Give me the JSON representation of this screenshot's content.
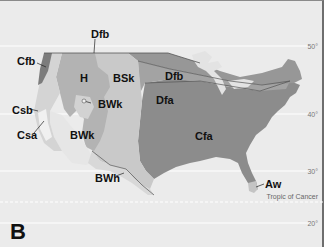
{
  "map": {
    "panel_letter": "B",
    "latitudes": [
      {
        "label": "50°",
        "y": 45
      },
      {
        "label": "40°",
        "y": 113
      },
      {
        "label": "30°",
        "y": 170
      },
      {
        "label": "20°",
        "y": 222
      }
    ],
    "tropic_label": "Tropic of Cancer",
    "regions": {
      "Cfb": "Cfb",
      "Dfb_north": "Dfb",
      "H": "H",
      "BSk": "BSk",
      "Dfb": "Dfb",
      "Dfa": "Dfa",
      "BWk_small": "BWk",
      "Csb": "Csb",
      "Csa": "Csa",
      "BWk": "BWk",
      "Cfa": "Cfa",
      "BWh": "BWh",
      "Aw": "Aw"
    },
    "colors": {
      "background": "#ebebeb",
      "Cfa": "#8c8c8c",
      "Dfa": "#a3a3a3",
      "Dfb": "#979797",
      "BSk": "#c9c9c9",
      "H": "#b3b3b3",
      "BWk": "#e6e6e6",
      "Cfb": "#7c7c7c",
      "Cs": "#d4d4d4",
      "lakes": "#e3e3e3"
    }
  }
}
